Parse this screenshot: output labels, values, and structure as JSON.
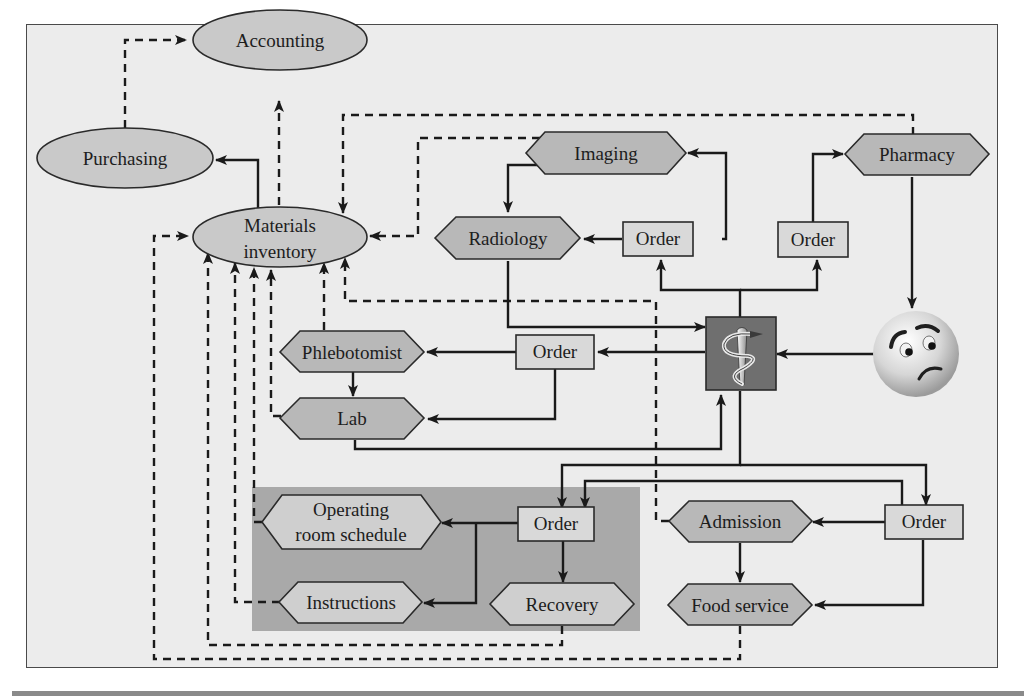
{
  "diagram": {
    "colors": {
      "background": "#ececec",
      "node_fill": "#c9c9c9",
      "surgery_group_fill": "#a9a9a9",
      "surgery_node_fill": "#cfcfcf",
      "order_fill": "#d9d9d9",
      "caduceus_box": "#6f6f6f",
      "line": "#1a1a1a"
    },
    "nodes": {
      "accounting": {
        "label": "Accounting",
        "shape": "ellipse"
      },
      "purchasing": {
        "label": "Purchasing",
        "shape": "ellipse"
      },
      "materials_inventory": {
        "label_line1": "Materials",
        "label_line2": "inventory",
        "shape": "ellipse"
      },
      "imaging": {
        "label": "Imaging",
        "shape": "hexagon"
      },
      "pharmacy": {
        "label": "Pharmacy",
        "shape": "hexagon"
      },
      "radiology": {
        "label": "Radiology",
        "shape": "hexagon"
      },
      "order_radiology": {
        "label": "Order",
        "shape": "rect"
      },
      "order_pharmacy": {
        "label": "Order",
        "shape": "rect"
      },
      "phlebotomist": {
        "label": "Phlebotomist",
        "shape": "hexagon"
      },
      "order_lab": {
        "label": "Order",
        "shape": "rect"
      },
      "lab": {
        "label": "Lab",
        "shape": "hexagon"
      },
      "physician": {
        "label": "",
        "shape": "caduceus-icon"
      },
      "patient": {
        "label": "",
        "shape": "worried-face-icon"
      },
      "operating_room_schedule": {
        "label_line1": "Operating",
        "label_line2": "room schedule",
        "shape": "hexagon"
      },
      "order_surgery": {
        "label": "Order",
        "shape": "rect"
      },
      "instructions": {
        "label": "Instructions",
        "shape": "hexagon"
      },
      "recovery": {
        "label": "Recovery",
        "shape": "hexagon"
      },
      "admission": {
        "label": "Admission",
        "shape": "hexagon"
      },
      "order_admission": {
        "label": "Order",
        "shape": "rect"
      },
      "food_service": {
        "label": "Food service",
        "shape": "hexagon"
      }
    },
    "edges": [
      {
        "from": "purchasing",
        "to": "accounting",
        "style": "dashed"
      },
      {
        "from": "materials_inventory",
        "to": "accounting",
        "style": "dashed"
      },
      {
        "from": "materials_inventory",
        "to": "purchasing",
        "style": "solid"
      },
      {
        "from": "pharmacy",
        "to": "materials_inventory",
        "style": "dashed"
      },
      {
        "from": "imaging",
        "to": "materials_inventory",
        "style": "dashed"
      },
      {
        "from": "imaging",
        "to": "radiology",
        "style": "solid"
      },
      {
        "from": "order_radiology",
        "to": "imaging",
        "style": "solid"
      },
      {
        "from": "order_radiology",
        "to": "radiology",
        "style": "solid"
      },
      {
        "from": "order_pharmacy",
        "to": "pharmacy",
        "style": "solid"
      },
      {
        "from": "physician",
        "to": "order_radiology",
        "style": "solid"
      },
      {
        "from": "physician",
        "to": "order_pharmacy",
        "style": "solid"
      },
      {
        "from": "pharmacy",
        "to": "patient",
        "style": "solid"
      },
      {
        "from": "patient",
        "to": "physician",
        "style": "solid"
      },
      {
        "from": "radiology",
        "to": "physician",
        "style": "solid"
      },
      {
        "from": "physician",
        "to": "order_lab",
        "style": "solid"
      },
      {
        "from": "order_lab",
        "to": "phlebotomist",
        "style": "solid"
      },
      {
        "from": "order_lab",
        "to": "lab",
        "style": "solid"
      },
      {
        "from": "phlebotomist",
        "to": "lab",
        "style": "solid"
      },
      {
        "from": "lab",
        "to": "physician",
        "style": "solid"
      },
      {
        "from": "phlebotomist",
        "to": "materials_inventory",
        "style": "dashed"
      },
      {
        "from": "lab",
        "to": "materials_inventory",
        "style": "dashed"
      },
      {
        "from": "physician",
        "to": "order_surgery",
        "style": "solid"
      },
      {
        "from": "physician",
        "to": "order_admission",
        "style": "solid"
      },
      {
        "from": "order_admission",
        "to": "order_surgery",
        "style": "solid"
      },
      {
        "from": "order_surgery",
        "to": "operating_room_schedule",
        "style": "solid"
      },
      {
        "from": "order_surgery",
        "to": "instructions",
        "style": "solid"
      },
      {
        "from": "order_surgery",
        "to": "recovery",
        "style": "solid"
      },
      {
        "from": "order_admission",
        "to": "admission",
        "style": "solid"
      },
      {
        "from": "order_admission",
        "to": "food_service",
        "style": "solid"
      },
      {
        "from": "admission",
        "to": "food_service",
        "style": "solid"
      },
      {
        "from": "operating_room_schedule",
        "to": "materials_inventory",
        "style": "dashed"
      },
      {
        "from": "instructions",
        "to": "materials_inventory",
        "style": "dashed"
      },
      {
        "from": "recovery",
        "to": "materials_inventory",
        "style": "dashed"
      },
      {
        "from": "admission",
        "to": "materials_inventory",
        "style": "dashed"
      },
      {
        "from": "food_service",
        "to": "materials_inventory",
        "style": "dashed"
      }
    ]
  }
}
